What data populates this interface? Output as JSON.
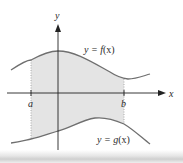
{
  "figure": {
    "type": "area-between-curves",
    "axes": {
      "x_label": "x",
      "y_label": "y"
    },
    "bounds": {
      "left_label": "a",
      "right_label": "b"
    },
    "curves": [
      {
        "name": "f",
        "label_prefix": "y = ",
        "label_func": "f",
        "label_arg": "(x)"
      },
      {
        "name": "g",
        "label_prefix": "y = ",
        "label_func": "g",
        "label_arg": "(x)"
      }
    ],
    "colors": {
      "curve": "#6f6f6f",
      "axis": "#222222",
      "shade": "#e4e4e4",
      "bound_line": "#9a9a9a"
    }
  }
}
